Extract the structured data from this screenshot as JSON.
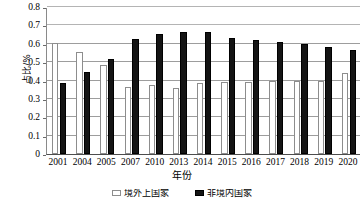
{
  "chart_data": {
    "type": "bar",
    "title": "",
    "xlabel": "年份",
    "ylabel": "占比/%",
    "ylim": [
      0,
      0.8
    ],
    "ytick_labels": [
      "0",
      "0.1",
      "0.2",
      "0.3",
      "0.4",
      "0.5",
      "0.6",
      "0.7",
      "0.8"
    ],
    "ytick_values": [
      0,
      0.1,
      0.2,
      0.3,
      0.4,
      0.5,
      0.6,
      0.7,
      0.8
    ],
    "grid": true,
    "legend_position": "bottom",
    "categories": [
      "2001",
      "2004",
      "2005",
      "2007",
      "2010",
      "2013",
      "2014",
      "2015",
      "2016",
      "2017",
      "2018",
      "2019",
      "2020"
    ],
    "series": [
      {
        "name": "境外上国家",
        "color": "#ffffff",
        "values": [
          0.605,
          0.555,
          0.485,
          0.365,
          0.375,
          0.36,
          0.385,
          0.39,
          0.39,
          0.395,
          0.4,
          0.4,
          0.44
        ]
      },
      {
        "name": "非境内国家",
        "color": "#141414",
        "values": [
          0.385,
          0.445,
          0.515,
          0.625,
          0.655,
          0.665,
          0.665,
          0.63,
          0.62,
          0.61,
          0.6,
          0.585,
          0.565
        ]
      }
    ]
  },
  "axis": {
    "x_title": "年份",
    "y_title": "占比/%"
  }
}
